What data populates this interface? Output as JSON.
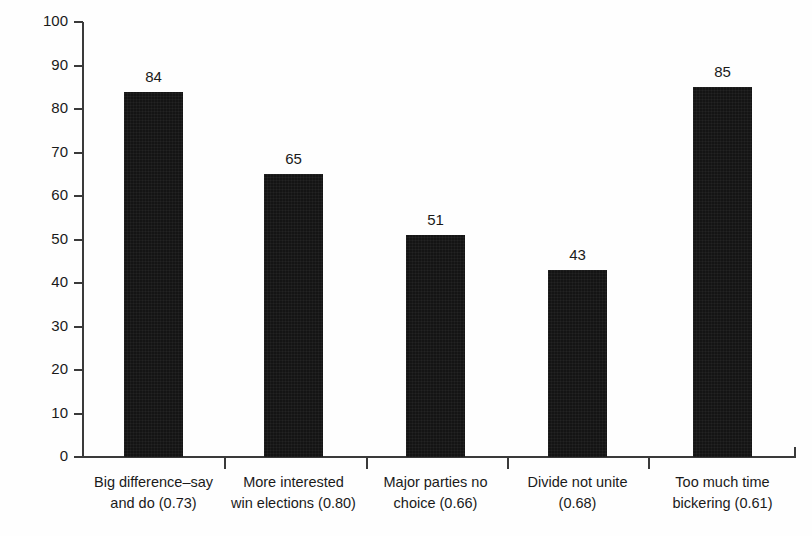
{
  "chart_data": {
    "type": "bar",
    "title": "",
    "xlabel": "",
    "ylabel": "Per cent agree",
    "ylim": [
      0,
      100
    ],
    "yticks": [
      0,
      10,
      20,
      30,
      40,
      50,
      60,
      70,
      80,
      90,
      100
    ],
    "grid": false,
    "legend": "none",
    "categories": [
      "Big difference–say and do (0.73)",
      "More interested win elections (0.80)",
      "Major parties no choice (0.66)",
      "Divide not unite (0.68)",
      "Too much time bickering (0.61)"
    ],
    "category_lines": [
      [
        "Big difference–say",
        "and do (0.73)"
      ],
      [
        "More interested",
        "win elections (0.80)"
      ],
      [
        "Major parties no",
        "choice (0.66)"
      ],
      [
        "Divide not unite",
        "(0.68)"
      ],
      [
        "Too much time",
        "bickering (0.61)"
      ]
    ],
    "values": [
      84,
      65,
      51,
      43,
      85
    ],
    "value_labels": [
      "84",
      "65",
      "51",
      "43",
      "85"
    ],
    "loadings": [
      0.73,
      0.8,
      0.66,
      0.68,
      0.61
    ],
    "bar_color": "#141414",
    "axis_color": "#3a3a3a",
    "background": "#ffffff"
  },
  "axes": {
    "y_tick_labels": [
      "100",
      "90",
      "80",
      "70",
      "60",
      "50",
      "40",
      "30",
      "20",
      "10",
      "0"
    ],
    "y_axis_title": "Per cent agree"
  }
}
